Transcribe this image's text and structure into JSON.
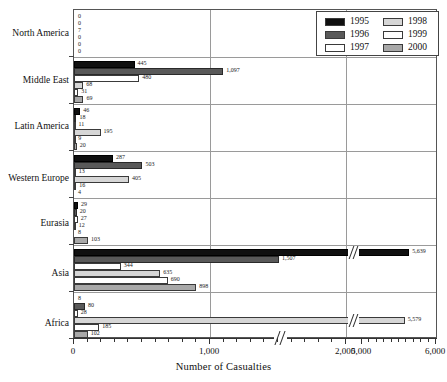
{
  "chart_data": {
    "type": "bar",
    "orientation": "horizontal",
    "title": "",
    "xlabel": "Number of Casualties",
    "ylabel": "",
    "xlim": [
      0,
      6000
    ],
    "axis_break": {
      "from": 2000,
      "to": 5000,
      "note": "x-axis is broken between 2,000 and 5,000"
    },
    "xticks_major": [
      0,
      1000,
      2000,
      5000,
      6000
    ],
    "xtick_labels": [
      "0",
      "1,000",
      "2,000",
      "5,000",
      "6,000"
    ],
    "grid": "vertical gridlines at 1,000 and 2,000; horizontal separators between regions",
    "legend_position": "top-right",
    "categories": [
      "North America",
      "Middle East",
      "Latin America",
      "Western Europe",
      "Eurasia",
      "Asia",
      "Africa"
    ],
    "series": [
      {
        "name": "1995",
        "color": "#101010",
        "values": [
          0,
          445,
          46,
          287,
          29,
          5639,
          8
        ]
      },
      {
        "name": "1996",
        "color": "#595959",
        "values": [
          0,
          1097,
          18,
          503,
          20,
          1507,
          80
        ]
      },
      {
        "name": "1997",
        "color": "#ffffff",
        "values": [
          7,
          480,
          11,
          13,
          27,
          344,
          28
        ]
      },
      {
        "name": "1998",
        "color": "#d6d6d6",
        "values": [
          0,
          68,
          195,
          405,
          12,
          635,
          5579
        ]
      },
      {
        "name": "1999",
        "color": "#ffffff",
        "values": [
          0,
          31,
          9,
          16,
          8,
          690,
          185
        ]
      },
      {
        "name": "2000",
        "color": "#a8a8a8",
        "values": [
          0,
          69,
          20,
          4,
          103,
          898,
          102
        ]
      }
    ],
    "data_labels": {
      "North America": [
        "0",
        "0",
        "7",
        "0",
        "0",
        "0"
      ],
      "Middle East": [
        "445",
        "1,097",
        "480",
        "68",
        "31",
        "69"
      ],
      "Latin America": [
        "46",
        "18",
        "11",
        "195",
        "9",
        "20"
      ],
      "Western Europe": [
        "287",
        "503",
        "13",
        "405",
        "16",
        "4"
      ],
      "Eurasia": [
        "29",
        "20",
        "27",
        "12",
        "8",
        "103"
      ],
      "Asia": [
        "5,639",
        "1,507",
        "344",
        "635",
        "690",
        "898"
      ],
      "Africa": [
        "8",
        "80",
        "28",
        "5,579",
        "185",
        "102"
      ]
    }
  },
  "legend": {
    "entries": [
      {
        "label": "1995"
      },
      {
        "label": "1996"
      },
      {
        "label": "1997"
      },
      {
        "label": "1998"
      },
      {
        "label": "1999"
      },
      {
        "label": "2000"
      }
    ]
  }
}
